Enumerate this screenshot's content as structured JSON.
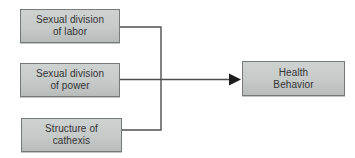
{
  "diagram": {
    "nodes": {
      "labor": {
        "label": "Sexual division\nof labor"
      },
      "power": {
        "label": "Sexual division\nof power"
      },
      "cathexis": {
        "label": "Structure of\ncathexis"
      },
      "health": {
        "label": "Health\nBehavior"
      }
    },
    "edges": [
      {
        "from": "Sexual division of labor",
        "to": "Health Behavior"
      },
      {
        "from": "Sexual division of power",
        "to": "Health Behavior"
      },
      {
        "from": "Structure of cathexis",
        "to": "Health Behavior"
      }
    ],
    "colors": {
      "background": "#ffffff",
      "node_fill_top": "#ced2d1",
      "node_fill_bottom": "#b7bcba",
      "node_border": "#767a79",
      "connector_line": "#4f4f4f",
      "arrowhead": "#1c1c1c",
      "text": "#333333"
    }
  }
}
